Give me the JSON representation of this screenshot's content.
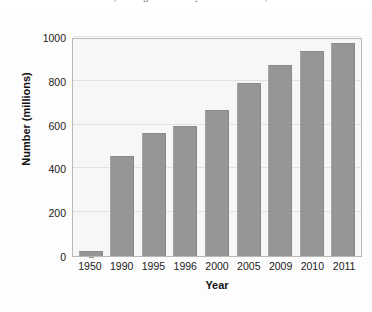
{
  "page": {
    "clipped_top_text": "and 1990, although statistically from a low base; s"
  },
  "chart_data": {
    "type": "bar",
    "title": "",
    "xlabel": "Year",
    "ylabel": "Number (millions)",
    "categories": [
      "1950",
      "1990",
      "1995",
      "1996",
      "2000",
      "2005",
      "2009",
      "2010",
      "2011"
    ],
    "values": [
      23,
      457,
      563,
      595,
      668,
      792,
      870,
      935,
      973
    ],
    "ylim": [
      0,
      1000
    ],
    "yticks": [
      0,
      200,
      400,
      600,
      800,
      1000
    ],
    "ytick_labels": [
      "0",
      "200",
      "400",
      "600",
      "800",
      "1000"
    ],
    "grid": true,
    "legend": "none",
    "orientation": "vertical",
    "series": [
      {
        "name": "Number (millions)",
        "values": [
          23,
          457,
          563,
          595,
          668,
          792,
          870,
          935,
          973
        ]
      }
    ]
  },
  "style": {
    "bar_color": "#969696",
    "plot_background": "#f7f7f7",
    "page_background": "#fdfdfd",
    "frame_color": "#b9b9b9",
    "gridline_color": "#e2e2e2",
    "text_color": "#1a1a1a"
  }
}
